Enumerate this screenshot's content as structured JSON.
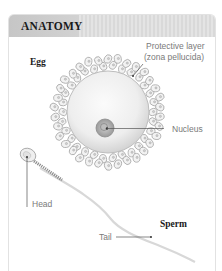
{
  "header": {
    "title": "ANATOMY"
  },
  "labels": {
    "egg": "Egg",
    "protective_layer_line1": "Protective layer",
    "protective_layer_line2": "(zona pellucida)",
    "nucleus": "Nucleus",
    "head": "Head",
    "sperm": "Sperm",
    "tail": "Tail"
  },
  "colors": {
    "header_bg": "#dddddd",
    "label_text": "#7a7a7a",
    "title_text": "#1a1a1a"
  }
}
